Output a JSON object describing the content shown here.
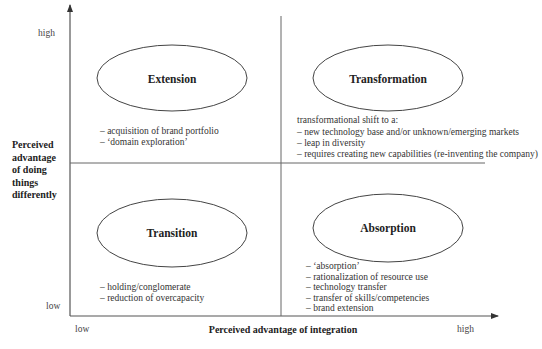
{
  "diagram": {
    "title": "",
    "axes": {
      "y": {
        "label_lines": [
          "Perceived",
          "advantage",
          "of doing",
          "things",
          "differently"
        ],
        "high": "high",
        "low": "low"
      },
      "x": {
        "label": "Perceived advantage of integration",
        "low": "low",
        "high": "high"
      }
    },
    "quadrants": {
      "top_left": {
        "name": "Extension",
        "items": [
          "– acquisition of brand portfolio",
          "– ‘domain exploration’"
        ]
      },
      "top_right": {
        "name": "Transformation",
        "intro": "transformational shift to a:",
        "items": [
          "– new technology base and/or unknown/emerging markets",
          "– leap in diversity",
          "– requires creating new capabilities (re-inventing the company)"
        ]
      },
      "bottom_left": {
        "name": "Transition",
        "items": [
          "– holding/conglomerate",
          "– reduction of overcapacity"
        ]
      },
      "bottom_right": {
        "name": "Absorption",
        "items": [
          "– ‘absorption’",
          "– rationalization of  resource use",
          "– technology transfer",
          "– transfer of  skills/competencies",
          "– brand extension"
        ]
      }
    },
    "colors": {
      "line": "#555555",
      "text": "#2a2a2a",
      "background": "#ffffff"
    }
  }
}
